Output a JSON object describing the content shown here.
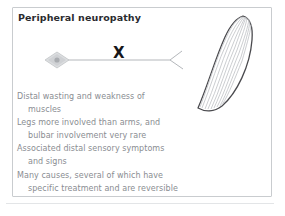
{
  "figure": {
    "title": "Peripheral neuropathy",
    "colors": {
      "panel_border": "#c9cccf",
      "title_text": "#2b2b2f",
      "body_text": "#8a8d92",
      "lesion_mark": "#16161a",
      "nerve_line": "#b4b7bb",
      "muscle_outline": "#4a4a4e",
      "muscle_fibers": "#c2c4c8",
      "soma_fill": "#d9dbdd",
      "rule": "#e3e5e7"
    },
    "lesion_mark": "X",
    "diagram": {
      "soma_label": "neuron-cell-body",
      "axon_label": "axon",
      "terminal_label": "nerve-terminal",
      "muscle_label": "muscle"
    },
    "body_lines": [
      {
        "text": "Distal wasting and weakness of",
        "indent": false
      },
      {
        "text": "muscles",
        "indent": true
      },
      {
        "text": "Legs more involved than arms, and",
        "indent": false
      },
      {
        "text": "bulbar involvement very rare",
        "indent": true
      },
      {
        "text": "Associated distal sensory symptoms",
        "indent": false
      },
      {
        "text": "and signs",
        "indent": true
      },
      {
        "text": "Many causes, several of which have",
        "indent": false
      },
      {
        "text": "specific treatment and are reversible",
        "indent": true
      }
    ]
  }
}
